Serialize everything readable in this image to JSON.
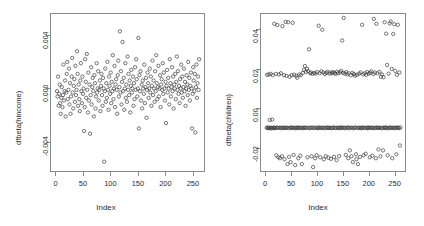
{
  "figure": {
    "background": "#ffffff",
    "frame_color": "#8a8a8a",
    "point_color": "#3a3a3a"
  },
  "chart_data": [
    {
      "type": "scatter",
      "panel": "left",
      "title": "76 * 77",
      "xlabel": "Index",
      "ylabel": "dfbeta(hincome)",
      "xlim": [
        -10,
        272
      ],
      "ylim": [
        -0.0062,
        0.0056
      ],
      "xticks": [
        0,
        50,
        100,
        150,
        200,
        250
      ],
      "yticks": [
        -0.004,
        0.0,
        0.004
      ],
      "ytick_labels": [
        "-0.004",
        "0.000",
        "0.004"
      ],
      "grid": false,
      "legend": "none",
      "marker": "open-circle",
      "x": [
        1,
        2,
        3,
        4,
        5,
        6,
        7,
        8,
        9,
        10,
        11,
        12,
        13,
        14,
        15,
        16,
        17,
        18,
        19,
        20,
        21,
        22,
        23,
        24,
        25,
        26,
        27,
        28,
        29,
        30,
        31,
        32,
        33,
        34,
        35,
        36,
        37,
        38,
        39,
        40,
        41,
        42,
        43,
        44,
        45,
        46,
        47,
        48,
        49,
        50,
        51,
        52,
        53,
        54,
        55,
        56,
        57,
        58,
        59,
        60,
        61,
        62,
        63,
        64,
        65,
        66,
        67,
        68,
        69,
        70,
        71,
        72,
        73,
        74,
        75,
        76,
        77,
        78,
        79,
        80,
        81,
        82,
        83,
        84,
        85,
        86,
        87,
        88,
        89,
        90,
        91,
        92,
        93,
        94,
        95,
        96,
        97,
        98,
        99,
        100,
        101,
        102,
        103,
        104,
        105,
        106,
        107,
        108,
        109,
        110,
        111,
        112,
        113,
        114,
        115,
        116,
        117,
        118,
        119,
        120,
        121,
        122,
        123,
        124,
        125,
        126,
        127,
        128,
        129,
        130,
        131,
        132,
        133,
        134,
        135,
        136,
        137,
        138,
        139,
        140,
        141,
        142,
        143,
        144,
        145,
        146,
        147,
        148,
        149,
        150,
        151,
        152,
        153,
        154,
        155,
        156,
        157,
        158,
        159,
        160,
        161,
        162,
        163,
        164,
        165,
        166,
        167,
        168,
        169,
        170,
        171,
        172,
        173,
        174,
        175,
        176,
        177,
        178,
        179,
        180,
        181,
        182,
        183,
        184,
        185,
        186,
        187,
        188,
        189,
        190,
        191,
        192,
        193,
        194,
        195,
        196,
        197,
        198,
        199,
        200,
        201,
        202,
        203,
        204,
        205,
        206,
        207,
        208,
        209,
        210,
        211,
        212,
        213,
        214,
        215,
        216,
        217,
        218,
        219,
        220,
        221,
        222,
        223,
        224,
        225,
        226,
        227,
        228,
        229,
        230,
        231,
        232,
        233,
        234,
        235,
        236,
        237,
        238,
        239,
        240,
        241,
        242,
        243,
        244,
        245,
        246,
        247,
        248,
        249,
        250,
        251,
        252,
        253,
        254,
        255,
        256,
        257,
        258,
        259,
        260,
        261,
        262,
        263
      ],
      "y": [
        -0.0002,
        -0.0006,
        0.0009,
        -0.0013,
        -0.0004,
        0.0003,
        -0.0011,
        -0.0019,
        -0.0007,
        0.0001,
        -0.0014,
        -0.0005,
        0.0018,
        -0.0009,
        -0.0002,
        0.0006,
        -0.0021,
        -0.0003,
        0.0011,
        0.002,
        -0.0008,
        -0.0001,
        0.0015,
        -0.0012,
        0.0004,
        -0.0019,
        -0.0006,
        0.0009,
        0.0023,
        -0.0003,
        -0.0015,
        0.0002,
        0.0007,
        -0.001,
        0.0017,
        -0.0005,
        -0.0001,
        0.0028,
        0.0011,
        -0.0013,
        0.0003,
        -0.0008,
        -0.0017,
        0.0006,
        0.0019,
        -0.0002,
        -0.0011,
        0.0009,
        -0.0004,
        0.0,
        -0.0032,
        -0.0014,
        0.0022,
        0.0005,
        -0.0007,
        0.0026,
        -0.0001,
        -0.0018,
        0.0012,
        -0.0009,
        0.0003,
        -0.0034,
        -0.0005,
        0.0016,
        -0.0012,
        0.0001,
        0.0008,
        -0.0002,
        -0.0021,
        0.001,
        0.0004,
        -0.0015,
        -0.0006,
        0.0019,
        -0.0003,
        0.0,
        0.0013,
        -0.0009,
        -0.0001,
        0.0006,
        -0.0017,
        0.0002,
        0.0011,
        -0.0005,
        -0.0013,
        0.0008,
        0.0,
        -0.0055,
        -0.0002,
        0.0015,
        -0.001,
        0.0004,
        -0.0007,
        0.002,
        -0.0001,
        -0.0016,
        0.0009,
        0.0002,
        -0.0004,
        0.0012,
        -0.0011,
        0.0005,
        -0.0002,
        0.0025,
        -0.0008,
        0.0,
        0.0017,
        -0.0014,
        0.0003,
        0.0007,
        -0.0001,
        -0.0019,
        0.001,
        0.0021,
        -0.0006,
        0.0001,
        0.0043,
        -0.0003,
        0.0013,
        -0.0012,
        0.0005,
        0.0035,
        -0.0002,
        0.0008,
        -0.0016,
        0.0,
        0.0019,
        -0.0007,
        0.0003,
        -0.001,
        0.0024,
        -0.0001,
        0.0011,
        -0.0005,
        0.0006,
        -0.0018,
        0.0002,
        0.0014,
        -0.0003,
        0.0,
        0.0009,
        -0.0013,
        0.0004,
        -0.0008,
        0.0016,
        -0.0001,
        0.0022,
        0.0007,
        -0.0006,
        0.0,
        0.0038,
        -0.003,
        0.001,
        -0.0002,
        0.0013,
        -0.0009,
        0.0003,
        -0.0015,
        0.0006,
        0.0,
        -0.0004,
        0.0018,
        -0.0011,
        0.0001,
        0.0008,
        -0.0022,
        -0.0001,
        0.0012,
        0.0004,
        -0.0007,
        0.0,
        0.0015,
        -0.0003,
        0.0009,
        -0.0013,
        0.0002,
        0.0021,
        -0.0005,
        0.0006,
        0.0,
        -0.001,
        0.0013,
        -0.0002,
        0.0025,
        0.0004,
        -0.0008,
        0.0001,
        0.0017,
        -0.0006,
        0.0,
        0.001,
        -0.0014,
        0.0003,
        0.0007,
        -0.0001,
        0.0019,
        -0.0004,
        0.0012,
        0.0,
        -0.0009,
        0.0005,
        -0.0026,
        0.0002,
        0.0014,
        -0.0003,
        0.0008,
        0.0,
        -0.0012,
        0.0022,
        0.0004,
        -0.0006,
        0.0001,
        0.0016,
        -0.0002,
        0.0009,
        -0.0015,
        0.0003,
        0.0,
        0.0011,
        -0.0008,
        0.0005,
        0.0024,
        -0.0001,
        0.0013,
        -0.0004,
        0.0002,
        -0.0011,
        0.0007,
        0.0,
        0.0018,
        -0.0003,
        0.0009,
        -0.0007,
        0.0001,
        0.0015,
        -0.0002,
        0.0005,
        -0.0013,
        0.0,
        0.001,
        0.0003,
        -0.0005,
        0.002,
        -0.0001,
        0.0008,
        -0.0009,
        0.0002,
        0.0012,
        0.0,
        -0.003,
        -0.0004,
        0.0016,
        0.0006,
        -0.0002,
        0.0011,
        -0.0033,
        0.0001,
        0.0018,
        -0.0007,
        0.0004,
        0.0009,
        -0.0001,
        0.0022,
        0.0,
        -0.0012,
        0.0007,
        0.0002
      ]
    },
    {
      "type": "scatter",
      "panel": "right",
      "title": "",
      "xlabel": "Index",
      "ylabel": "dfbeta(children)",
      "xlim": [
        -10,
        272
      ],
      "ylim": [
        -0.032,
        0.048
      ],
      "xticks": [
        0,
        50,
        100,
        150,
        200,
        250
      ],
      "yticks": [
        -0.02,
        0.0,
        0.02,
        0.04
      ],
      "ytick_labels": [
        "-0.02",
        "0.00",
        "0.02",
        "0.04"
      ],
      "grid": false,
      "legend": "none",
      "marker": "open-circle",
      "bands": [
        {
          "name": "upper-outliers",
          "center": 0.042,
          "spread": 0.004
        },
        {
          "name": "upper-band",
          "center": 0.018,
          "spread": 0.003
        },
        {
          "name": "center-band",
          "center": -0.01,
          "spread": 0.001
        },
        {
          "name": "lower-band",
          "center": -0.024,
          "spread": 0.004
        }
      ],
      "x": [
        1,
        2,
        3,
        4,
        5,
        6,
        7,
        8,
        9,
        10,
        11,
        12,
        13,
        14,
        15,
        16,
        17,
        18,
        19,
        20,
        21,
        22,
        23,
        24,
        25,
        26,
        27,
        28,
        29,
        30,
        31,
        32,
        33,
        34,
        35,
        36,
        37,
        38,
        39,
        40,
        41,
        42,
        43,
        44,
        45,
        46,
        47,
        48,
        49,
        50,
        51,
        52,
        53,
        54,
        55,
        56,
        57,
        58,
        59,
        60,
        61,
        62,
        63,
        64,
        65,
        66,
        67,
        68,
        69,
        70,
        71,
        72,
        73,
        74,
        75,
        76,
        77,
        78,
        79,
        80,
        81,
        82,
        83,
        84,
        85,
        86,
        87,
        88,
        89,
        90,
        91,
        92,
        93,
        94,
        95,
        96,
        97,
        98,
        99,
        100,
        101,
        102,
        103,
        104,
        105,
        106,
        107,
        108,
        109,
        110,
        111,
        112,
        113,
        114,
        115,
        116,
        117,
        118,
        119,
        120,
        121,
        122,
        123,
        124,
        125,
        126,
        127,
        128,
        129,
        130,
        131,
        132,
        133,
        134,
        135,
        136,
        137,
        138,
        139,
        140,
        141,
        142,
        143,
        144,
        145,
        146,
        147,
        148,
        149,
        150,
        151,
        152,
        153,
        154,
        155,
        156,
        157,
        158,
        159,
        160,
        161,
        162,
        163,
        164,
        165,
        166,
        167,
        168,
        169,
        170,
        171,
        172,
        173,
        174,
        175,
        176,
        177,
        178,
        179,
        180,
        181,
        182,
        183,
        184,
        185,
        186,
        187,
        188,
        189,
        190,
        191,
        192,
        193,
        194,
        195,
        196,
        197,
        198,
        199,
        200,
        201,
        202,
        203,
        204,
        205,
        206,
        207,
        208,
        209,
        210,
        211,
        212,
        213,
        214,
        215,
        216,
        217,
        218,
        219,
        220,
        221,
        222,
        223,
        224,
        225,
        226,
        227,
        228,
        229,
        230,
        231,
        232,
        233,
        234,
        235,
        236,
        237,
        238,
        239,
        240,
        241,
        242,
        243,
        244,
        245,
        246,
        247,
        248,
        249,
        250,
        251,
        252,
        253,
        254,
        255,
        256,
        257,
        258,
        259,
        260,
        261,
        262,
        263
      ],
      "y": [
        -0.01,
        0.017,
        -0.0098,
        -0.0102,
        0.0172,
        -0.0101,
        -0.006,
        -0.0099,
        0.0175,
        -0.0103,
        -0.01,
        -0.0058,
        0.0168,
        -0.0101,
        -0.0099,
        0.043,
        -0.0102,
        -0.01,
        0.0175,
        -0.024,
        -0.0098,
        0.0424,
        -0.0101,
        -0.025,
        0.0172,
        -0.01,
        -0.0255,
        -0.0099,
        0.0178,
        -0.0102,
        -0.0245,
        0.0418,
        -0.01,
        -0.0098,
        0.0168,
        -0.026,
        -0.0101,
        0.044,
        -0.01,
        0.0165,
        -0.0099,
        -0.0285,
        0.0438,
        -0.0102,
        -0.0248,
        0.016,
        -0.01,
        -0.0275,
        -0.0098,
        0.0168,
        -0.0101,
        0.0435,
        -0.01,
        -0.0238,
        0.017,
        -0.0099,
        -0.029,
        -0.0102,
        0.0165,
        -0.01,
        0.0155,
        -0.0098,
        -0.0255,
        -0.0101,
        0.0172,
        -0.01,
        -0.0242,
        0.0168,
        -0.0099,
        -0.0285,
        -0.0102,
        0.018,
        -0.01,
        0.0195,
        -0.0098,
        0.0215,
        -0.0101,
        0.0185,
        -0.01,
        0.02,
        -0.025,
        0.019,
        -0.0099,
        0.03,
        -0.0102,
        0.0178,
        -0.01,
        0.0182,
        -0.0245,
        -0.0098,
        0.0175,
        -0.03,
        -0.0101,
        0.018,
        -0.01,
        -0.0255,
        0.0176,
        -0.0099,
        -0.024,
        0.0184,
        -0.0102,
        -0.01,
        0.042,
        -0.0098,
        0.0178,
        -0.025,
        -0.0101,
        0.0188,
        -0.01,
        0.04,
        -0.0099,
        0.0182,
        -0.026,
        -0.0102,
        0.0174,
        -0.01,
        -0.0245,
        0.018,
        -0.0098,
        0.0186,
        -0.0101,
        -0.0252,
        -0.01,
        0.0176,
        -0.0099,
        0.0182,
        -0.0258,
        -0.0102,
        0.0178,
        -0.01,
        0.0184,
        -0.0098,
        -0.0248,
        0.018,
        -0.0101,
        0.0175,
        -0.01,
        -0.0265,
        0.0186,
        -0.0099,
        0.0178,
        -0.0102,
        -0.0244,
        -0.01,
        0.0182,
        -0.0098,
        0.019,
        -0.0101,
        0.0345,
        -0.01,
        0.018,
        0.046,
        -0.0099,
        0.0176,
        -0.0102,
        -0.0238,
        0.0184,
        -0.01,
        0.0172,
        -0.0098,
        -0.0255,
        0.0178,
        -0.0101,
        -0.0215,
        -0.01,
        0.0168,
        -0.0245,
        -0.0099,
        0.018,
        -0.0275,
        -0.0102,
        0.0174,
        -0.01,
        0.0166,
        -0.0098,
        -0.0235,
        -0.026,
        0.017,
        -0.0101,
        -0.0285,
        -0.01,
        0.0176,
        -0.0099,
        -0.0248,
        0.0182,
        -0.0102,
        -0.01,
        0.0425,
        -0.0098,
        0.0172,
        -0.024,
        -0.0101,
        0.0178,
        -0.01,
        -0.0232,
        0.017,
        -0.0099,
        0.0184,
        -0.0102,
        -0.01,
        0.0176,
        -0.0098,
        -0.025,
        0.018,
        -0.0101,
        0.0188,
        -0.01,
        -0.0242,
        -0.0099,
        0.0174,
        0.0455,
        -0.0102,
        0.0182,
        -0.01,
        -0.0255,
        0.043,
        -0.0098,
        0.0178,
        -0.0101,
        -0.021,
        -0.01,
        0.0185,
        -0.0099,
        -0.0245,
        0.016,
        -0.0102,
        0.0172,
        -0.01,
        -0.0215,
        0.0158,
        -0.0098,
        0.0438,
        -0.0101,
        -0.01,
        0.038,
        -0.0099,
        0.022,
        -0.024,
        -0.0102,
        0.0176,
        -0.01,
        0.0432,
        -0.0098,
        0.0442,
        -0.0101,
        0.02,
        -0.0255,
        -0.01,
        0.0378,
        -0.0099,
        0.0428,
        -0.0102,
        0.019,
        -0.01,
        -0.0235,
        0.017,
        -0.0098,
        0.0425,
        -0.0101,
        -0.01,
        0.0182,
        -0.019,
        -0.0099
      ]
    }
  ]
}
